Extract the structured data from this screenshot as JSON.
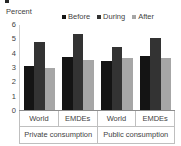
{
  "chart_data": {
    "type": "bar",
    "title": "",
    "ylabel": "Percent",
    "xlabel": "",
    "ylim": [
      0,
      6
    ],
    "yticks": [
      "0",
      "1",
      "2",
      "3",
      "4",
      "5",
      "6"
    ],
    "grid": false,
    "legend_position": "top-right",
    "categories": [
      "World",
      "EMDEs",
      "World",
      "EMDEs"
    ],
    "group_labels": [
      "Private consumption",
      "Public consumption"
    ],
    "series": [
      {
        "name": "Before",
        "color": "#141414",
        "values": [
          3.1,
          3.75,
          3.45,
          3.8
        ]
      },
      {
        "name": "During",
        "color": "#333333",
        "values": [
          4.8,
          5.35,
          4.45,
          5.05
        ]
      },
      {
        "name": "After",
        "color": "#a6a6a6",
        "values": [
          3.0,
          3.55,
          3.65,
          3.65
        ]
      }
    ]
  }
}
